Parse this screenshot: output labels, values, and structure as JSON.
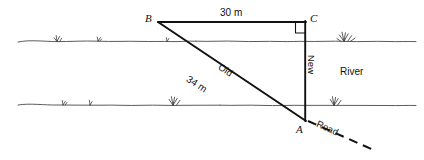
{
  "diagram": {
    "scene": "river",
    "vertices": [
      {
        "id": "B",
        "label": "B",
        "x": 158,
        "y": 22
      },
      {
        "id": "C",
        "label": "C",
        "x": 305,
        "y": 22
      },
      {
        "id": "A",
        "label": "A",
        "x": 305,
        "y": 120
      }
    ],
    "measures": {
      "top_side": "30 m",
      "hypotenuse": "34 m"
    },
    "route_labels": {
      "old": "Old",
      "new": "New",
      "road": "Road"
    },
    "scene_labels": {
      "river": "River"
    },
    "right_angle": {
      "at": "C",
      "present": true
    },
    "colors": {
      "ink": "#111111",
      "bank": "#555555",
      "background": "#ffffff"
    }
  }
}
